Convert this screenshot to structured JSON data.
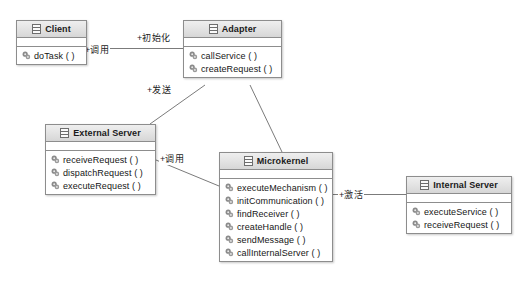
{
  "diagram": {
    "title_strip": "",
    "classes": [
      {
        "id": "client",
        "name": "Client",
        "icon": "class-icon",
        "operations": [
          {
            "label": "doTask ( )",
            "icon": "operation-icon"
          }
        ]
      },
      {
        "id": "adapter",
        "name": "Adapter",
        "icon": "class-icon",
        "operations": [
          {
            "label": "callService ( )",
            "icon": "operation-icon"
          },
          {
            "label": "createRequest ( )",
            "icon": "operation-icon"
          }
        ]
      },
      {
        "id": "external-server",
        "name": "External Server",
        "icon": "class-icon",
        "operations": [
          {
            "label": "receiveRequest ( )",
            "icon": "operation-icon"
          },
          {
            "label": "dispatchRequest ( )",
            "icon": "operation-icon"
          },
          {
            "label": "executeRequest ( )",
            "icon": "operation-icon"
          }
        ]
      },
      {
        "id": "microkernel",
        "name": "Microkernel",
        "icon": "class-icon",
        "operations": [
          {
            "label": "executeMechanism ( )",
            "icon": "operation-icon"
          },
          {
            "label": "initCommunication ( )",
            "icon": "operation-icon"
          },
          {
            "label": "findReceiver ( )",
            "icon": "operation-icon"
          },
          {
            "label": "createHandle ( )",
            "icon": "operation-icon"
          },
          {
            "label": "sendMessage ( )",
            "icon": "operation-icon"
          },
          {
            "label": "callInternalServer ( )",
            "icon": "operation-icon"
          }
        ]
      },
      {
        "id": "internal-server",
        "name": "Internal Server",
        "icon": "class-icon",
        "operations": [
          {
            "label": "executeService ( )",
            "icon": "operation-icon"
          },
          {
            "label": "receiveRequest ( )",
            "icon": "operation-icon"
          }
        ]
      }
    ],
    "edge_labels": [
      {
        "id": "init",
        "text": "+初始化"
      },
      {
        "id": "call-client-adapter",
        "text": "+调用"
      },
      {
        "id": "send",
        "text": "+发送"
      },
      {
        "id": "call-external-microkernel",
        "text": "+调用"
      },
      {
        "id": "activate",
        "text": "+激活"
      }
    ],
    "colors": {
      "line": "#7b7b7b",
      "border": "#8d8d8d",
      "header_top": "#efefef",
      "header_bottom": "#d6d6d6",
      "text": "#161616",
      "icon_fill": "#8a8a8a"
    }
  }
}
